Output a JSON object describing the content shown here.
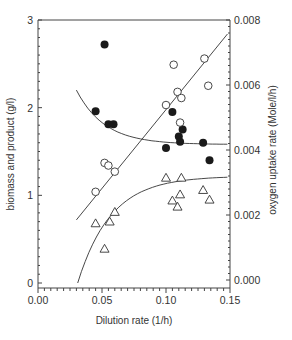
{
  "chart_data": {
    "type": "scatter",
    "title": "",
    "xlabel": "Dilution rate (1/h)",
    "ylabel": "biomass and product (g/l)",
    "y2label": "oxygen uptake rate (Mole/l/h)",
    "xlim": [
      0.0,
      0.15
    ],
    "ylim": [
      0,
      3
    ],
    "y2lim": [
      0.0,
      0.008
    ],
    "x_ticks": [
      "0.00",
      "0.05",
      "0.10",
      "0.15"
    ],
    "y_ticks": [
      "0",
      "1",
      "2",
      "3"
    ],
    "y2_ticks": [
      "0.000",
      "0.002",
      "0.004",
      "0.006",
      "0.008"
    ],
    "grid": false,
    "series": [
      {
        "name": "filled circles",
        "marker": "filled-circle",
        "axis": "left",
        "points": [
          [
            0.052,
            2.72
          ],
          [
            0.045,
            1.96
          ],
          [
            0.055,
            1.81
          ],
          [
            0.059,
            1.81
          ],
          [
            0.105,
            1.95
          ],
          [
            0.113,
            1.75
          ],
          [
            0.11,
            1.67
          ],
          [
            0.111,
            1.61
          ],
          [
            0.1,
            1.54
          ],
          [
            0.129,
            1.6
          ],
          [
            0.134,
            1.4
          ]
        ]
      },
      {
        "name": "open circles",
        "marker": "open-circle",
        "axis": "left",
        "points": [
          [
            0.045,
            1.04
          ],
          [
            0.052,
            1.37
          ],
          [
            0.055,
            1.34
          ],
          [
            0.06,
            1.27
          ],
          [
            0.1,
            2.03
          ],
          [
            0.109,
            2.18
          ],
          [
            0.112,
            2.11
          ],
          [
            0.106,
            2.49
          ],
          [
            0.13,
            2.56
          ],
          [
            0.133,
            2.25
          ],
          [
            0.111,
            1.83
          ]
        ]
      },
      {
        "name": "open triangles",
        "marker": "open-triangle",
        "axis": "left",
        "points": [
          [
            0.045,
            0.68
          ],
          [
            0.052,
            0.39
          ],
          [
            0.056,
            0.7
          ],
          [
            0.06,
            0.81
          ],
          [
            0.1,
            1.2
          ],
          [
            0.112,
            1.2
          ],
          [
            0.111,
            1.01
          ],
          [
            0.105,
            0.94
          ],
          [
            0.109,
            0.87
          ],
          [
            0.129,
            1.06
          ],
          [
            0.134,
            0.95
          ]
        ]
      }
    ],
    "fits": [
      {
        "name": "open-circle linear fit",
        "from": [
          0.03,
          0.72
        ],
        "to": [
          0.148,
          2.84
        ]
      },
      {
        "name": "filled-circle decay fit",
        "from": [
          0.03,
          2.18
        ],
        "to": [
          0.148,
          1.6
        ]
      },
      {
        "name": "triangle saturation fit",
        "from": [
          0.031,
          0.0
        ],
        "to": [
          0.148,
          1.1
        ]
      }
    ]
  }
}
